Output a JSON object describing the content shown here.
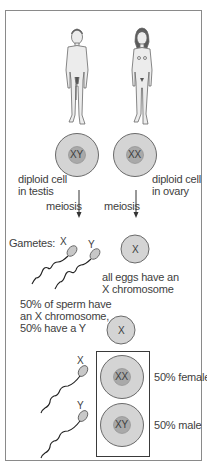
{
  "figures": {
    "male": {
      "label": "male-figure"
    },
    "female": {
      "label": "female-figure"
    }
  },
  "parents": {
    "male_cell": {
      "chromosomes": "XY",
      "caption_line1": "diploid cell",
      "caption_line2": "in testis"
    },
    "female_cell": {
      "chromosomes": "XX",
      "caption_line1": "diploid cell",
      "caption_line2": "in ovary"
    }
  },
  "process": {
    "male_arrow_label": "meiosis",
    "female_arrow_label": "meiosis"
  },
  "gametes": {
    "heading": "Gametes:",
    "sperm_x_label": "X",
    "sperm_y_label": "Y",
    "sperm_caption_line1": "50% of sperm have",
    "sperm_caption_line2": "an X chromosome,",
    "sperm_caption_line3": "50% have a Y",
    "egg_label": "X",
    "egg_caption_line1": "all eggs have an",
    "egg_caption_line2": "X chromosome"
  },
  "fertilisation": {
    "egg_label": "X",
    "sperm_x_label": "X",
    "sperm_y_label": "Y",
    "female_zygote": "XX",
    "male_zygote": "XY",
    "female_result": "50% female",
    "male_result": "50% male"
  },
  "colors": {
    "cell_outer": "#d4d4d4",
    "cell_nucleus": "#a9a9a9",
    "outline": "#6a6a6a",
    "text": "#3e3e3e",
    "border": "#8a8a8a"
  }
}
